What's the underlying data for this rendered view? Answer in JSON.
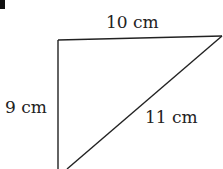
{
  "figure": {
    "type": "triangle",
    "sides": {
      "top": "10 cm",
      "left": "9 cm",
      "hypotenuse": "11 cm"
    },
    "stroke_color": "#222222"
  }
}
